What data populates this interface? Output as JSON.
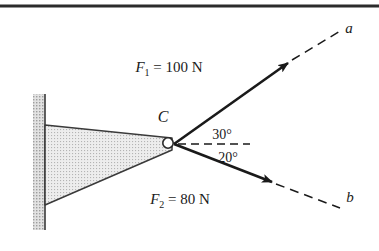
{
  "figure": {
    "background_color": "#ffffff",
    "line_color": "#1a1a1a",
    "hatch_color": "#9a9a9a",
    "bracket_fill": "#d8d8d8",
    "wall_fill": "#c0c0c0",
    "top_rule_color": "#2b2b2b"
  },
  "labels": {
    "point_c": "C",
    "ray_a": "a",
    "ray_b": "b"
  },
  "forces": [
    {
      "name": "F1",
      "symbol": "F",
      "subscript": "1",
      "equals": "=",
      "magnitude": "100",
      "unit": "N",
      "full_text": "F₁ = 100 N",
      "angle_deg": 30,
      "angle_text": "30°",
      "direction": "above-horizontal",
      "ray_label": "a"
    },
    {
      "name": "F2",
      "symbol": "F",
      "subscript": "2",
      "equals": "=",
      "magnitude": "80",
      "unit": "N",
      "full_text": "F₂ = 80 N",
      "angle_deg": 20,
      "angle_text": "20°",
      "direction": "below-horizontal",
      "ray_label": "b"
    }
  ],
  "angles": {
    "upper": "30°",
    "lower": "20°"
  },
  "geometry": {
    "vertex_x": 174,
    "vertex_y": 144,
    "pin_center_x": 168,
    "pin_center_y": 143,
    "pin_radius": 5,
    "wall_left": 33,
    "wall_right": 45,
    "wall_top": 94,
    "wall_bottom": 230,
    "bracket_top_y": 125,
    "bracket_bottom_y": 205,
    "f1_tip_x": 288,
    "f1_tip_y": 63,
    "f2_tip_x": 272,
    "f2_tip_y": 182,
    "dashed_ref_end_x": 250,
    "top_rule_y": 6
  }
}
